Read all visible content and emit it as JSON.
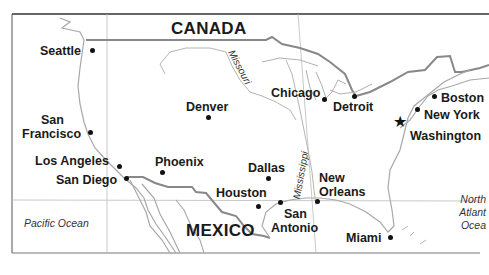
{
  "map": {
    "countries": [
      {
        "name": "CANADA"
      },
      {
        "name": "MEXICO"
      }
    ],
    "oceans": [
      {
        "name": "Pacific Ocean"
      },
      {
        "name": "North Atlantic Ocean",
        "lines": [
          "North",
          "Atlant",
          "Ocea"
        ]
      }
    ],
    "rivers": [
      {
        "name": "Missouri"
      },
      {
        "name": "Mississippi"
      }
    ],
    "cities": [
      {
        "name": "Seattle"
      },
      {
        "name": "San Francisco",
        "lines": [
          "San",
          "Francisco"
        ]
      },
      {
        "name": "Los Angeles"
      },
      {
        "name": "San Diego"
      },
      {
        "name": "Phoenix"
      },
      {
        "name": "Denver"
      },
      {
        "name": "Dallas"
      },
      {
        "name": "Houston"
      },
      {
        "name": "San Antonio",
        "lines": [
          "San",
          "Antonio"
        ]
      },
      {
        "name": "New Orleans",
        "lines": [
          "New",
          "Orleans"
        ]
      },
      {
        "name": "Chicago"
      },
      {
        "name": "Detroit"
      },
      {
        "name": "Boston"
      },
      {
        "name": "New York"
      },
      {
        "name": "Washington",
        "capital": true
      },
      {
        "name": "Miami"
      }
    ],
    "colors": {
      "border": "#8a8a8a",
      "coast": "#a8a8a8",
      "grid": "#bdbdbd",
      "frame": "#444444",
      "text": "#1a1a1a"
    }
  }
}
